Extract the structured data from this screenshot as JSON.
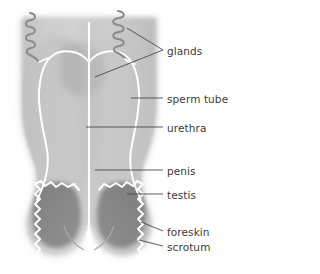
{
  "diagram": {
    "style": "grayscale anatomical illustration",
    "colors": {
      "background": "#ffffff",
      "body_fill": "#c9c9c9",
      "body_fill_light": "#d8d8d8",
      "body_shadow": "#b3b3b3",
      "testis_fill": "#888888",
      "tube_stroke": "#ffffff",
      "center_line": "#ffffff",
      "gland_stroke": "#8d8d8d",
      "leader_line": "#4a4a4a",
      "label_text": "#3b3b3b"
    },
    "parts": [
      {
        "id": "glands",
        "label": "glands",
        "label_x": 167,
        "label_y": 46
      },
      {
        "id": "sperm_tube",
        "label": "sperm tube",
        "label_x": 167,
        "label_y": 94
      },
      {
        "id": "urethra",
        "label": "urethra",
        "label_x": 167,
        "label_y": 123
      },
      {
        "id": "penis",
        "label": "penis",
        "label_x": 167,
        "label_y": 166
      },
      {
        "id": "testis",
        "label": "testis",
        "label_x": 167,
        "label_y": 190
      },
      {
        "id": "foreskin",
        "label": "foreskin",
        "label_x": 167,
        "label_y": 227
      },
      {
        "id": "scrotum",
        "label": "scrotum",
        "label_x": 167,
        "label_y": 242
      }
    ]
  }
}
